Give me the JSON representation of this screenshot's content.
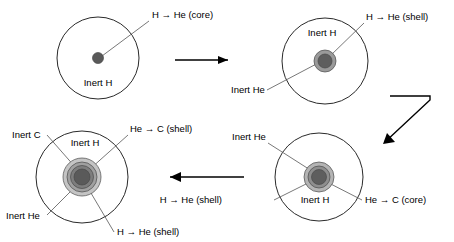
{
  "figure": {
    "width": 454,
    "height": 242,
    "background": "#ffffff",
    "text_color": "#000000",
    "outline_color": "#2a2a2a",
    "leader_color": "#555555"
  },
  "panels": [
    {
      "id": "panel-1",
      "name": "main-sequence-star",
      "center": {
        "x": 98,
        "y": 58
      },
      "outer_radius": 41,
      "zones": [
        {
          "name": "core",
          "radius": 5.5,
          "fill": "#595959"
        }
      ],
      "labels": [
        {
          "name": "core-reaction-label",
          "text": "H → He (core)",
          "x": 152,
          "y": 18,
          "anchor": "start"
        },
        {
          "name": "inert-h-label",
          "text": "Inert H",
          "x": 98,
          "y": 86,
          "anchor": "middle"
        }
      ],
      "leaders": [
        {
          "name": "core-leader",
          "x1": 149,
          "y1": 21,
          "x2": 102,
          "y2": 56
        }
      ]
    },
    {
      "id": "panel-2",
      "name": "hydrogen-shell-burning-star",
      "center": {
        "x": 325,
        "y": 61
      },
      "outer_radius": 43,
      "zones": [
        {
          "name": "shell",
          "radius": 11,
          "fill": "#9a9a9a"
        },
        {
          "name": "core",
          "radius": 7,
          "fill": "#5e5e5e"
        }
      ],
      "labels": [
        {
          "name": "shell-reaction-label",
          "text": "H → He (shell)",
          "x": 366,
          "y": 20,
          "anchor": "start"
        },
        {
          "name": "inert-h-label",
          "text": "Inert H",
          "x": 322,
          "y": 36,
          "anchor": "middle"
        },
        {
          "name": "inert-he-label",
          "text": "Inert He",
          "x": 231,
          "y": 93,
          "anchor": "start"
        }
      ],
      "leaders": [
        {
          "name": "shell-leader",
          "x1": 364,
          "y1": 23,
          "x2": 329,
          "y2": 57
        },
        {
          "name": "inert-he-leader",
          "x1": 267,
          "y1": 90,
          "x2": 322,
          "y2": 61
        }
      ]
    },
    {
      "id": "panel-3",
      "name": "helium-core-burning-star",
      "center": {
        "x": 319,
        "y": 177
      },
      "outer_radius": 44,
      "zones": [
        {
          "name": "outer-shell",
          "radius": 15,
          "fill": "#b4b4b4"
        },
        {
          "name": "middle-shell",
          "radius": 11,
          "fill": "#8e8e8e"
        },
        {
          "name": "core",
          "radius": 7.5,
          "fill": "#5e5e5e"
        }
      ],
      "labels": [
        {
          "name": "inert-he-label",
          "text": "Inert He",
          "x": 232,
          "y": 140,
          "anchor": "start"
        },
        {
          "name": "inert-h-label",
          "text": "Inert H",
          "x": 315,
          "y": 203,
          "anchor": "middle"
        },
        {
          "name": "shell-reaction-label",
          "text": "H → He (shell)",
          "x": 222,
          "y": 203,
          "anchor": "end"
        },
        {
          "name": "core-reaction-label",
          "text": "He → C (core)",
          "x": 365,
          "y": 203,
          "anchor": "start"
        }
      ],
      "leaders": [
        {
          "name": "inert-he-leader",
          "x1": 268,
          "y1": 143,
          "x2": 315,
          "y2": 173
        },
        {
          "name": "shell-leader",
          "x1": 274,
          "y1": 200,
          "x2": 314,
          "y2": 180
        },
        {
          "name": "core-leader",
          "x1": 362,
          "y1": 200,
          "x2": 323,
          "y2": 180
        }
      ]
    },
    {
      "id": "panel-4",
      "name": "double-shell-burning-star",
      "center": {
        "x": 82,
        "y": 177
      },
      "outer_radius": 46,
      "zones": [
        {
          "name": "outer-shell",
          "radius": 19,
          "fill": "#c4c4c4"
        },
        {
          "name": "carbon-shell",
          "radius": 15,
          "fill": "#a0a0a0"
        },
        {
          "name": "helium-shell",
          "radius": 11.5,
          "fill": "#7d7d7d"
        },
        {
          "name": "core",
          "radius": 8,
          "fill": "#5a5a5a"
        }
      ],
      "labels": [
        {
          "name": "he-c-shell-label",
          "text": "He → C (shell)",
          "x": 130,
          "y": 132,
          "anchor": "start"
        },
        {
          "name": "inert-c-label",
          "text": "Inert C",
          "x": 12,
          "y": 138,
          "anchor": "start"
        },
        {
          "name": "inert-h-label",
          "text": "Inert H",
          "x": 85,
          "y": 146,
          "anchor": "middle"
        },
        {
          "name": "inert-he-label",
          "text": "Inert He",
          "x": 6,
          "y": 219,
          "anchor": "start"
        },
        {
          "name": "h-he-shell-label",
          "text": "H → He (shell)",
          "x": 117,
          "y": 235,
          "anchor": "start"
        }
      ],
      "leaders": [
        {
          "name": "he-c-shell-leader",
          "x1": 128,
          "y1": 135,
          "x2": 90,
          "y2": 169
        },
        {
          "name": "inert-c-leader",
          "x1": 47,
          "y1": 135,
          "x2": 76,
          "y2": 168
        },
        {
          "name": "inert-he-leader",
          "x1": 47,
          "y1": 215,
          "x2": 76,
          "y2": 186
        },
        {
          "name": "h-he-shell-leader",
          "x1": 114,
          "y1": 232,
          "x2": 88,
          "y2": 188
        }
      ]
    }
  ],
  "arrows": [
    {
      "id": "arrow-1",
      "name": "flow-arrow-panel1-to-panel2",
      "direction": "right",
      "points": "175,60 228,60",
      "head": "228,60 218,56 218,64"
    },
    {
      "id": "arrow-2",
      "name": "flow-arrow-panel2-to-panel3",
      "direction": "down-left-elbow",
      "points": "390,96 430,96 430,100 385,142",
      "head": "383,144 395,142 387,133"
    },
    {
      "id": "arrow-3",
      "name": "flow-arrow-panel3-to-panel4",
      "direction": "left",
      "points": "244,177 170,177",
      "head": "170,177 181,172 181,182"
    }
  ]
}
